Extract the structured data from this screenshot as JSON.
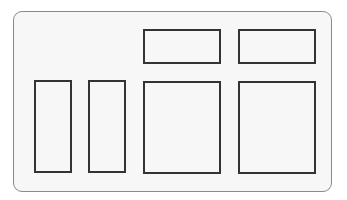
{
  "diagram": {
    "frame": {
      "x": 13,
      "y": 11,
      "w": 319,
      "h": 181,
      "border_color": "#8a8a8a",
      "fill": "#f7f7f7"
    },
    "boxes": [
      {
        "id": "top-left",
        "x": 143,
        "y": 29,
        "w": 78,
        "h": 35
      },
      {
        "id": "top-right",
        "x": 238,
        "y": 29,
        "w": 78,
        "h": 35
      },
      {
        "id": "narrow-1",
        "x": 34,
        "y": 80,
        "w": 38,
        "h": 93
      },
      {
        "id": "narrow-2",
        "x": 88,
        "y": 80,
        "w": 38,
        "h": 93
      },
      {
        "id": "wide-1",
        "x": 143,
        "y": 81,
        "w": 78,
        "h": 93
      },
      {
        "id": "wide-2",
        "x": 238,
        "y": 81,
        "w": 78,
        "h": 93
      }
    ],
    "box_border_color": "#333333"
  }
}
